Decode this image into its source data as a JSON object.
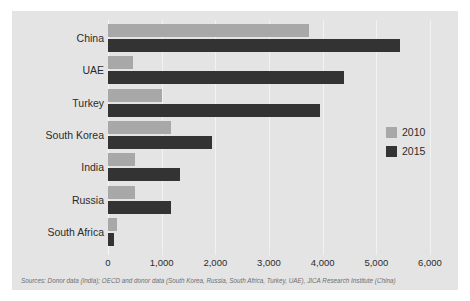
{
  "chart_data": {
    "type": "bar",
    "orientation": "horizontal",
    "title": "",
    "subtitle": "",
    "xlabel": "",
    "ylabel": "",
    "xlim": [
      0,
      6000
    ],
    "grid": true,
    "legend_position": "right",
    "categories": [
      "China",
      "UAE",
      "Turkey",
      "South Korea",
      "India",
      "Russia",
      "South Africa"
    ],
    "series": [
      {
        "name": "2010",
        "color": "#a8a8a8",
        "values": [
          3750,
          470,
          1000,
          1180,
          500,
          500,
          160
        ]
      },
      {
        "name": "2015",
        "color": "#333333",
        "values": [
          5450,
          4400,
          3950,
          1930,
          1350,
          1180,
          110
        ]
      }
    ],
    "xticks": [
      {
        "value": 0,
        "label": "0"
      },
      {
        "value": 1000,
        "label": "1,000"
      },
      {
        "value": 2000,
        "label": "2,000"
      },
      {
        "value": 3000,
        "label": "3,000"
      },
      {
        "value": 4000,
        "label": "4,000"
      },
      {
        "value": 5000,
        "label": "5,000"
      },
      {
        "value": 6000,
        "label": "6,000"
      }
    ],
    "source_note": "Sources: Donor data (India); OECD and donor data (South Korea, Russia, South Africa, Turkey, UAE), JICA Research Institute (China)"
  },
  "legend": {
    "items": [
      {
        "label": "2010",
        "color": "#a8a8a8"
      },
      {
        "label": "2015",
        "color": "#333333"
      }
    ]
  },
  "colors": {
    "page_background": "#ffffff",
    "panel_background": "#e4e4e4",
    "gridline": "#f2f2f2",
    "series_2010": "#a8a8a8",
    "series_2015": "#333333",
    "text": "#2b2b2b",
    "source_text": "#6e6e6e"
  }
}
